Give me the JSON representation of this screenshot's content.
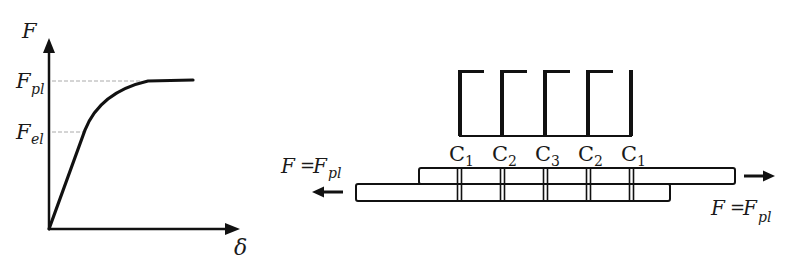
{
  "left_plot": {
    "y_axis_label": "F",
    "x_axis_label": "δ",
    "levels": [
      {
        "symbol": "F",
        "subscript": "pl"
      },
      {
        "symbol": "F",
        "subscript": "el"
      }
    ],
    "curve_description": "linear elastic rise to F_el, then curved transition plateauing at F_pl"
  },
  "right_diagram": {
    "connector_labels": [
      {
        "symbol": "C",
        "subscript": "1"
      },
      {
        "symbol": "C",
        "subscript": "2"
      },
      {
        "symbol": "C",
        "subscript": "3"
      },
      {
        "symbol": "C",
        "subscript": "2"
      },
      {
        "symbol": "C",
        "subscript": "1"
      }
    ],
    "left_force": {
      "lhs": "F",
      "eq": "=",
      "rhs": "F",
      "subscript": "pl",
      "direction": "left"
    },
    "right_force": {
      "lhs": "F",
      "eq": "=",
      "rhs": "F",
      "subscript": "pl",
      "direction": "right"
    }
  },
  "colors": {
    "line": "#111111",
    "dashed": "#aaaaaa",
    "background": "#ffffff"
  }
}
